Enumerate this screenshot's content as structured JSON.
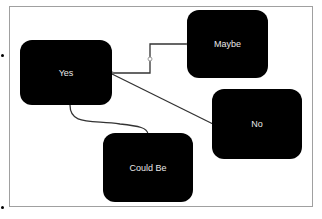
{
  "diagram": {
    "nodes": [
      {
        "id": "yes",
        "label": "Yes"
      },
      {
        "id": "maybe",
        "label": "Maybe"
      },
      {
        "id": "no",
        "label": "No"
      },
      {
        "id": "could_be",
        "label": "Could Be"
      }
    ],
    "edges": [
      {
        "from": "yes",
        "to": "maybe",
        "type": "elbow"
      },
      {
        "from": "yes",
        "to": "no",
        "type": "straight"
      },
      {
        "from": "yes",
        "to": "could_be",
        "type": "curved"
      }
    ],
    "colors": {
      "node_fill": "#000000",
      "node_text": "#e8e8e8",
      "connector": "#333333",
      "frame": "#a0a0a0"
    }
  }
}
